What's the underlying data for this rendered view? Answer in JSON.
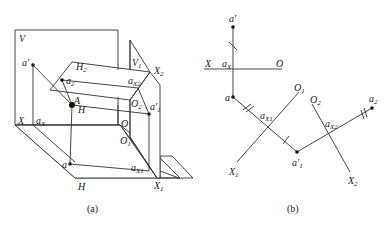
{
  "figure": {
    "panel_a": {
      "caption": "(a)",
      "planes": {
        "V": "V",
        "H": "H",
        "H2": {
          "base": "H",
          "sub": "2"
        },
        "V1": {
          "base": "V",
          "sub": "1"
        }
      },
      "axes": {
        "X": "X",
        "O": "O",
        "X1": {
          "base": "X",
          "sub": "1"
        },
        "O1": {
          "base": "O",
          "sub": "1"
        },
        "X2": {
          "base": "X",
          "sub": "2"
        },
        "O2": {
          "base": "O",
          "sub": "2"
        }
      },
      "points": {
        "A": "A",
        "a_prime": "a′",
        "a": "a",
        "a2": {
          "base": "a",
          "sub": "2"
        },
        "a1_prime": {
          "base": "a′",
          "sub": "1"
        },
        "aX": {
          "base": "a",
          "sub": "X"
        },
        "aX1": {
          "base": "a",
          "sub": "X1"
        },
        "aX2": {
          "base": "a",
          "sub": "X2"
        }
      }
    },
    "panel_b": {
      "caption": "(b)",
      "axes": {
        "X": "X",
        "O": "O",
        "X1": {
          "base": "X",
          "sub": "1"
        },
        "O1": {
          "base": "O",
          "sub": "1"
        },
        "X2": {
          "base": "X",
          "sub": "2"
        },
        "O2": {
          "base": "O",
          "sub": "2"
        }
      },
      "points": {
        "a_prime": "a′",
        "a": "a",
        "a1_prime": {
          "base": "a′",
          "sub": "1"
        },
        "a2": {
          "base": "a",
          "sub": "2"
        },
        "aX": {
          "base": "a",
          "sub": "X"
        },
        "aX1": {
          "base": "a",
          "sub": "X1"
        },
        "aX2": {
          "base": "a",
          "sub": "X2"
        }
      },
      "equal_distance_marks": [
        "single tick",
        "double tick"
      ]
    }
  }
}
